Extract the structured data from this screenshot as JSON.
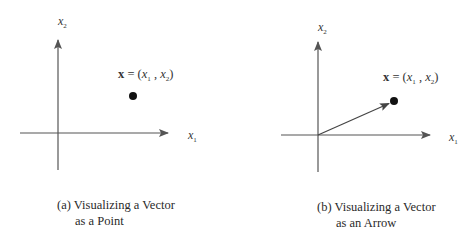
{
  "panels": [
    {
      "id": "a",
      "caption_line1": "(a) Visualizing a Vector",
      "caption_line2": "as a Point",
      "axis_x_label": "x",
      "axis_x_sub": "1",
      "axis_y_label": "x",
      "axis_y_sub": "2",
      "point_label": {
        "vec": "x",
        "eq": " = (",
        "c1": "x",
        "c1_sub": "1",
        "sep": " ,  ",
        "c2": "x",
        "c2_sub": "2",
        "close": ")"
      },
      "representation": "point"
    },
    {
      "id": "b",
      "caption_line1": "(b) Visualizing a Vector",
      "caption_line2": "as an Arrow",
      "axis_x_label": "x",
      "axis_x_sub": "1",
      "axis_y_label": "x",
      "axis_y_sub": "2",
      "point_label": {
        "vec": "x",
        "eq": " = (",
        "c1": "x",
        "c1_sub": "1",
        "sep": " ,  ",
        "c2": "x",
        "c2_sub": "2",
        "close": ")"
      },
      "representation": "arrow"
    }
  ],
  "colors": {
    "axis": "#555555",
    "point": "#111111",
    "text": "#333333"
  }
}
